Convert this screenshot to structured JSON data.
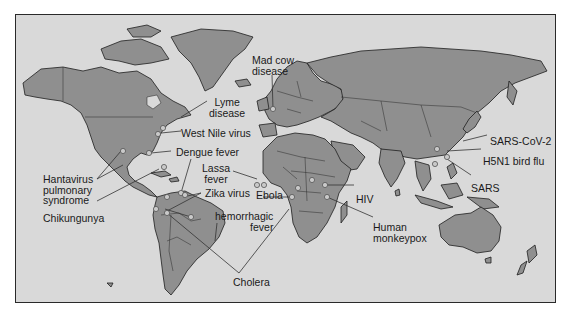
{
  "map": {
    "title": "Emerging infectious diseases world map",
    "colors": {
      "ocean": "#d9d9d9",
      "land": "#8f8f8f",
      "outline": "#1e1e1e",
      "marker": "#c9c9c9"
    },
    "labels": {
      "mad_cow": {
        "line1": "Mad cow",
        "line2": "disease"
      },
      "lyme": {
        "line1": "Lyme",
        "line2": "disease"
      },
      "west_nile": "West Nile virus",
      "dengue": "Dengue fever",
      "hantavirus": {
        "line1": "Hantavirus",
        "line2": "pulmonary",
        "line3": "syndrome"
      },
      "chikungunya": "Chikungunya",
      "lassa": {
        "line1": "Lassa",
        "line2": "fever"
      },
      "zika": "Zika virus",
      "ebola": "Ebola",
      "hemorrhagic": {
        "line1": "hemorrhagic",
        "line2": "fever"
      },
      "cholera": "Cholera",
      "hiv": "HIV",
      "monkeypox": {
        "line1": "Human",
        "line2": "monkeypox"
      },
      "sars_cov2": "SARS-CoV-2",
      "h5n1": "H5N1 bird flu",
      "sars": "SARS"
    }
  }
}
